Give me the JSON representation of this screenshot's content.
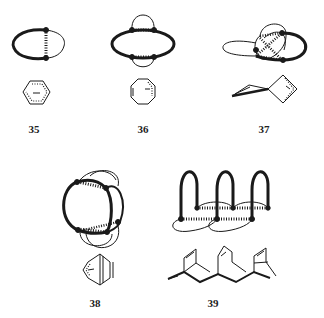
{
  "figure": {
    "type": "chemical-topology-diagram",
    "compounds": [
      {
        "id": "35",
        "label": "35",
        "topology": "single-loop with one homoconjugative bridge",
        "structure": "cyclohexadienyl anion (hexagon, dotted)"
      },
      {
        "id": "36",
        "label": "36",
        "topology": "loop with two bridges",
        "structure": "cyclooctatrienyl anion (octagon)"
      },
      {
        "id": "37",
        "label": "37",
        "topology": "spiro-linked loops with multiple bridges",
        "structure": "spiro bicyclic / cyclobutenyl"
      },
      {
        "id": "38",
        "label": "38",
        "topology": "two loops with multiple bridges",
        "structure": "bicyclic bridged anion"
      },
      {
        "id": "39",
        "label": "39",
        "topology": "triple arch ladder",
        "structure": "polycyclic ladder (norbornene-fused)"
      }
    ]
  },
  "colors": {
    "ink": "#1a1a1a",
    "background": "#ffffff"
  }
}
